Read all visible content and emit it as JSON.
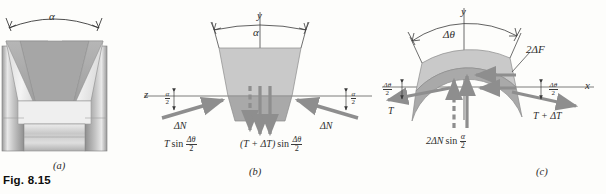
{
  "figure": {
    "number_label": "Fig. 8.15",
    "panels": [
      {
        "id": "a",
        "caption": "(a)",
        "name": "v-belt-pulley-groove-cross-section",
        "labels": {
          "angle": "α"
        }
      },
      {
        "id": "b",
        "caption": "(b)",
        "name": "belt-element-free-body-zy-plane",
        "labels": {
          "axis_y": "y",
          "axis_z": "z",
          "groove_angle": "α",
          "half_angle_left_num": "α",
          "half_angle_left_den": "2",
          "half_angle_right_num": "α",
          "half_angle_right_den": "2",
          "normal_force_left": "ΔN",
          "normal_force_right": "ΔN",
          "tension_left_pre": "T",
          "tension_left_fn": "sin",
          "tension_left_num": "Δθ",
          "tension_left_den": "2",
          "tension_right_pre": "(T + ΔT)",
          "tension_right_fn": "sin",
          "tension_right_num": "Δθ",
          "tension_right_den": "2"
        }
      },
      {
        "id": "c",
        "caption": "(c)",
        "name": "belt-element-free-body-xy-plane",
        "labels": {
          "axis_y": "y",
          "axis_x": "x",
          "subtended_angle": "Δθ",
          "friction_force": "2ΔF",
          "half_angle_left_num": "Δθ",
          "half_angle_left_den": "2",
          "half_angle_right_num": "Δθ",
          "half_angle_right_den": "2",
          "tension_left": "T",
          "tension_right": "T + ΔT",
          "normal_resultant_pre": "2ΔN",
          "normal_resultant_fn": "sin",
          "normal_resultant_num": "α",
          "normal_resultant_den": "2"
        }
      }
    ]
  },
  "colors": {
    "page_background": "#fdfdfb",
    "line": "#3a3a3a",
    "arrow_gray": "#8e8e8e",
    "belt_light": "#c9c9c9",
    "belt_dark": "#a9a9a9",
    "metal_light": "#f2f2f2",
    "metal_mid": "#bdbdbd",
    "metal_dark": "#8a8a8a"
  }
}
